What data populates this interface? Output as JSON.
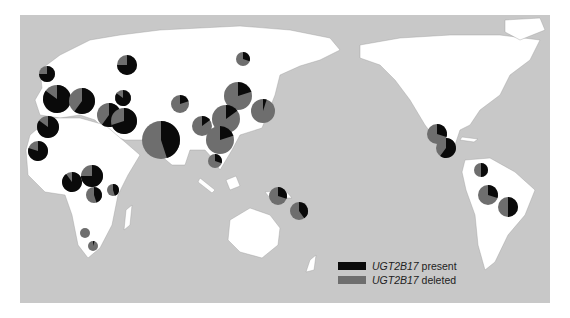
{
  "map": {
    "title": "",
    "ocean_color": "#c8c8c8",
    "land_color": "#ffffff",
    "frame_color": "#bcbcbc"
  },
  "legend": {
    "items": [
      {
        "gene": "UGT2B17",
        "state": "present",
        "color": "#0a0a0a"
      },
      {
        "gene": "UGT2B17",
        "state": "deleted",
        "color": "#6e6e6e"
      }
    ]
  },
  "pies": [
    {
      "region": "Britain/N Europe",
      "x": 47,
      "y": 74,
      "r": 8,
      "present": 0.75
    },
    {
      "region": "W Europe",
      "x": 57,
      "y": 99,
      "r": 14,
      "present": 0.85
    },
    {
      "region": "S Europe",
      "x": 82,
      "y": 101,
      "r": 13,
      "present": 0.6
    },
    {
      "region": "Russia W",
      "x": 127,
      "y": 65,
      "r": 10,
      "present": 0.75
    },
    {
      "region": "Caucasus",
      "x": 123,
      "y": 98,
      "r": 8,
      "present": 0.85
    },
    {
      "region": "Middle East 1",
      "x": 109,
      "y": 115,
      "r": 12,
      "present": 0.6
    },
    {
      "region": "Middle East 2",
      "x": 124,
      "y": 121,
      "r": 13,
      "present": 0.7
    },
    {
      "region": "N Africa 1",
      "x": 48,
      "y": 127,
      "r": 11,
      "present": 0.85
    },
    {
      "region": "N Africa 2",
      "x": 38,
      "y": 151,
      "r": 10,
      "present": 0.8
    },
    {
      "region": "S Asia",
      "x": 161,
      "y": 140,
      "r": 19,
      "present": 0.45
    },
    {
      "region": "Central Asia",
      "x": 180,
      "y": 104,
      "r": 9,
      "present": 0.2
    },
    {
      "region": "Siberia",
      "x": 243,
      "y": 59,
      "r": 7,
      "present": 0.3
    },
    {
      "region": "N China",
      "x": 238,
      "y": 96,
      "r": 14,
      "present": 0.2
    },
    {
      "region": "Japan",
      "x": 263,
      "y": 111,
      "r": 12,
      "present": 0.05
    },
    {
      "region": "China 1",
      "x": 202,
      "y": 126,
      "r": 10,
      "present": 0.15
    },
    {
      "region": "China 2",
      "x": 226,
      "y": 119,
      "r": 14,
      "present": 0.15
    },
    {
      "region": "SE Asia",
      "x": 220,
      "y": 140,
      "r": 14,
      "present": 0.2
    },
    {
      "region": "Indochina",
      "x": 215,
      "y": 161,
      "r": 7,
      "present": 0.3
    },
    {
      "region": "W Africa",
      "x": 72,
      "y": 182,
      "r": 10,
      "present": 0.9
    },
    {
      "region": "C Africa",
      "x": 92,
      "y": 176,
      "r": 11,
      "present": 0.75
    },
    {
      "region": "C Africa 2",
      "x": 94,
      "y": 195,
      "r": 8,
      "present": 0.45
    },
    {
      "region": "E Africa",
      "x": 113,
      "y": 190,
      "r": 6,
      "present": 0.45
    },
    {
      "region": "S Africa 1",
      "x": 85,
      "y": 233,
      "r": 5,
      "present": 0.0
    },
    {
      "region": "S Africa 2",
      "x": 93,
      "y": 246,
      "r": 5,
      "present": 0.05
    },
    {
      "region": "New Guinea",
      "x": 278,
      "y": 196,
      "r": 9,
      "present": 0.3
    },
    {
      "region": "Melanesia",
      "x": 299,
      "y": 211,
      "r": 9,
      "present": 0.4
    },
    {
      "region": "Mexico",
      "x": 437,
      "y": 134,
      "r": 10,
      "present": 0.3
    },
    {
      "region": "C America",
      "x": 446,
      "y": 148,
      "r": 10,
      "present": 0.6
    },
    {
      "region": "Colombia",
      "x": 481,
      "y": 170,
      "r": 7,
      "present": 0.5
    },
    {
      "region": "Amazon 1",
      "x": 488,
      "y": 195,
      "r": 10,
      "present": 0.3
    },
    {
      "region": "Amazon 2",
      "x": 508,
      "y": 207,
      "r": 10,
      "present": 0.5
    }
  ]
}
